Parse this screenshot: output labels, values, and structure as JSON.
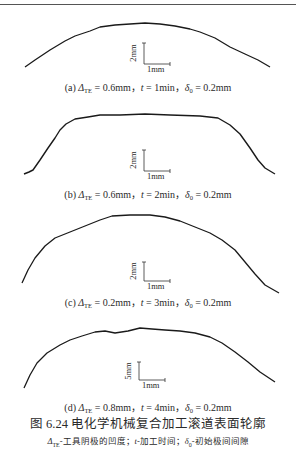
{
  "panels": [
    {
      "id": "a",
      "label": "(a)",
      "delta_te_symbol": "Δ",
      "delta_te_sub": "TE",
      "delta_te_value": " = 0.6mm，",
      "t_symbol": "t",
      "t_value": " = 1min，",
      "delta0_symbol": "δ",
      "delta0_sub": "0",
      "delta0_value": " = 0.2mm",
      "scale_vertical": "2mm",
      "scale_horizontal": "1mm",
      "profile": [
        [
          25,
          67
        ],
        [
          35,
          60
        ],
        [
          50,
          50
        ],
        [
          65,
          41
        ],
        [
          75,
          36
        ],
        [
          90,
          31
        ],
        [
          100,
          27
        ],
        [
          115,
          25
        ],
        [
          130,
          24
        ],
        [
          145,
          23
        ],
        [
          160,
          24
        ],
        [
          175,
          26
        ],
        [
          190,
          29
        ],
        [
          200,
          32
        ],
        [
          215,
          38
        ],
        [
          230,
          47
        ],
        [
          245,
          54
        ],
        [
          258,
          60
        ],
        [
          270,
          67
        ]
      ]
    },
    {
      "id": "b",
      "label": "(b)",
      "delta_te_symbol": "Δ",
      "delta_te_sub": "TE",
      "delta_te_value": " = 0.6mm，",
      "t_symbol": "t",
      "t_value": " = 2min，",
      "delta0_symbol": "δ",
      "delta0_sub": "0",
      "delta0_value": " = 0.2mm",
      "scale_vertical": "2mm",
      "scale_horizontal": "1mm",
      "profile": [
        [
          24,
          174
        ],
        [
          29,
          172
        ],
        [
          33,
          170
        ],
        [
          40,
          160
        ],
        [
          48,
          148
        ],
        [
          55,
          138
        ],
        [
          60,
          130
        ],
        [
          66,
          124
        ],
        [
          75,
          119
        ],
        [
          88,
          117
        ],
        [
          100,
          115
        ],
        [
          120,
          115
        ],
        [
          145,
          114
        ],
        [
          170,
          115
        ],
        [
          200,
          116
        ],
        [
          218,
          118
        ],
        [
          230,
          125
        ],
        [
          240,
          134
        ],
        [
          250,
          148
        ],
        [
          258,
          160
        ],
        [
          265,
          168
        ],
        [
          275,
          174
        ]
      ]
    },
    {
      "id": "c",
      "label": "(c)",
      "delta_te_symbol": "Δ",
      "delta_te_sub": "TE",
      "delta_te_value": " = 0.2mm，",
      "t_symbol": "t",
      "t_value": " = 3min，",
      "delta0_symbol": "δ",
      "delta0_sub": "0",
      "delta0_value": " = 0.2mm",
      "scale_vertical": "2mm",
      "scale_horizontal": "1mm",
      "profile": [
        [
          22,
          283
        ],
        [
          28,
          270
        ],
        [
          35,
          258
        ],
        [
          45,
          246
        ],
        [
          55,
          238
        ],
        [
          70,
          232
        ],
        [
          85,
          226
        ],
        [
          100,
          220
        ],
        [
          112,
          216
        ],
        [
          130,
          215
        ],
        [
          150,
          215
        ],
        [
          165,
          217
        ],
        [
          180,
          221
        ],
        [
          195,
          227
        ],
        [
          210,
          233
        ],
        [
          222,
          240
        ],
        [
          235,
          250
        ],
        [
          245,
          262
        ],
        [
          255,
          274
        ],
        [
          265,
          285
        ],
        [
          279,
          293
        ]
      ]
    },
    {
      "id": "d",
      "label": "(d)",
      "delta_te_symbol": "Δ",
      "delta_te_sub": "TE",
      "delta_te_value": " = 0.8mm，",
      "t_symbol": "t",
      "t_value": " = 4min，",
      "delta0_symbol": "δ",
      "delta0_sub": "0",
      "delta0_value": " = 0.2mm",
      "scale_vertical": "5mm",
      "scale_horizontal": "1mm",
      "profile": [
        [
          24,
          388
        ],
        [
          30,
          375
        ],
        [
          37,
          363
        ],
        [
          47,
          353
        ],
        [
          60,
          345
        ],
        [
          70,
          340
        ],
        [
          82,
          336
        ],
        [
          95,
          332
        ],
        [
          105,
          331
        ],
        [
          115,
          333
        ],
        [
          128,
          331
        ],
        [
          140,
          328
        ],
        [
          152,
          329
        ],
        [
          165,
          330
        ],
        [
          180,
          331
        ],
        [
          195,
          333
        ],
        [
          210,
          337
        ],
        [
          222,
          343
        ],
        [
          235,
          352
        ],
        [
          248,
          362
        ],
        [
          260,
          372
        ],
        [
          275,
          382
        ]
      ]
    }
  ],
  "figure": {
    "title": "图 6.24    电化学机械复合加工滚道表面轮廓",
    "note_prefix_symbol": "Δ",
    "note_prefix_sub": "TE",
    "note_part1": "-工具阴极的凹度；",
    "note_t_symbol": "t",
    "note_part2": "-加工时间；",
    "note_delta_symbol": "δ",
    "note_delta_sub": "0",
    "note_part3": "-初始极间间隙"
  },
  "colors": {
    "curve": "#1a1a1a",
    "text": "#2a2a2a",
    "rule": "#555555"
  }
}
